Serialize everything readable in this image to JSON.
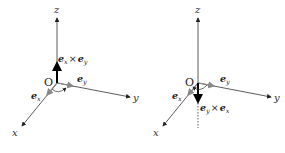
{
  "figures": [
    {
      "id": "left",
      "axes": {
        "x": "x",
        "y": "y",
        "z": "z"
      },
      "origin_label": "O",
      "vectors": {
        "ex": {
          "base": "e",
          "sub": "x"
        },
        "ey": {
          "base": "e",
          "sub": "y"
        },
        "result": {
          "a": "e",
          "a_sub": "x",
          "op": "×",
          "b": "e",
          "b_sub": "y"
        }
      },
      "result_direction": "up"
    },
    {
      "id": "right",
      "axes": {
        "x": "x",
        "y": "y",
        "z": "z"
      },
      "origin_label": "O",
      "vectors": {
        "ex": {
          "base": "e",
          "sub": "x"
        },
        "ey": {
          "base": "e",
          "sub": "y"
        },
        "result": {
          "a": "e",
          "a_sub": "y",
          "op": "×",
          "b": "e",
          "b_sub": "x"
        }
      },
      "result_direction": "down"
    }
  ],
  "colors": {
    "axis": "#333333",
    "unit_vector": "#888888",
    "result_vector": "#000000"
  }
}
